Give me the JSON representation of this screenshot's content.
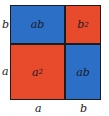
{
  "diagram": {
    "title": "",
    "colors": {
      "red": "#e84b2b",
      "blue": "#2b70c6",
      "border": "#1c1c1c"
    },
    "cells": {
      "top_left": {
        "base": "ab",
        "exp": "",
        "color": "blue"
      },
      "top_right": {
        "base": "b",
        "exp": "2",
        "color": "red"
      },
      "bottom_left": {
        "base": "a",
        "exp": "2",
        "color": "red"
      },
      "bottom_right": {
        "base": "ab",
        "exp": "",
        "color": "blue"
      }
    },
    "side_labels": {
      "left_top": "b",
      "left_bottom": "a",
      "bottom_left": "a",
      "bottom_right": "b"
    }
  }
}
